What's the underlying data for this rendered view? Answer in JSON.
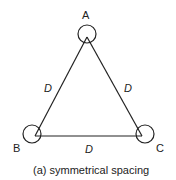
{
  "diagram": {
    "vertices": [
      {
        "id": "A",
        "label": "A"
      },
      {
        "id": "B",
        "label": "B"
      },
      {
        "id": "C",
        "label": "C"
      }
    ],
    "sides": [
      {
        "from": "A",
        "to": "B",
        "label": "D"
      },
      {
        "from": "A",
        "to": "C",
        "label": "D"
      },
      {
        "from": "B",
        "to": "C",
        "label": "D"
      }
    ],
    "caption": "(a) symmetrical spacing",
    "stroke_color": "#222222"
  }
}
